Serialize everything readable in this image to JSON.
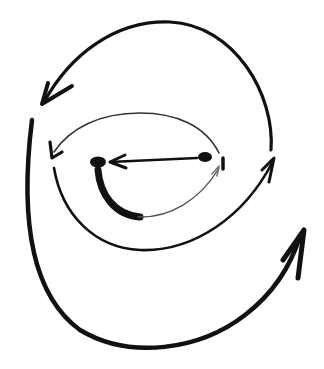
{
  "diagram": {
    "background": "#ffffff",
    "ink_color": "#111111",
    "faint_ink_color": "#777777",
    "text_labels": [],
    "elements": [
      {
        "id": "outer-top-arc",
        "kind": "curved-arrow",
        "direction": "right-to-left over top",
        "from": [
          270,
          148
        ],
        "to": [
          42,
          105
        ]
      },
      {
        "id": "outer-big-loop",
        "kind": "curved-arrow",
        "direction": "down left side, across bottom, up right side",
        "from": [
          32,
          118
        ],
        "to": [
          303,
          230
        ]
      },
      {
        "id": "middle-top-arc",
        "kind": "curved-arrow",
        "direction": "right-to-left over top",
        "from": [
          218,
          155
        ],
        "to": [
          52,
          155
        ]
      },
      {
        "id": "middle-bottom-loop",
        "kind": "curved-arrow",
        "direction": "left-to-right under bottom",
        "from": [
          52,
          165
        ],
        "to": [
          275,
          158
        ]
      },
      {
        "id": "inner-loop",
        "kind": "curved-arrow",
        "direction": "from left dot down and up to right",
        "from": [
          98,
          168
        ],
        "to": [
          218,
          168
        ]
      },
      {
        "id": "center-arrow",
        "kind": "straight-arrow",
        "direction": "right dot to left dot",
        "from": [
          198,
          158
        ],
        "to": [
          108,
          162
        ]
      },
      {
        "id": "left-dot",
        "kind": "dot",
        "at": [
          98,
          162
        ]
      },
      {
        "id": "right-dot",
        "kind": "dot",
        "at": [
          205,
          157
        ]
      }
    ]
  }
}
